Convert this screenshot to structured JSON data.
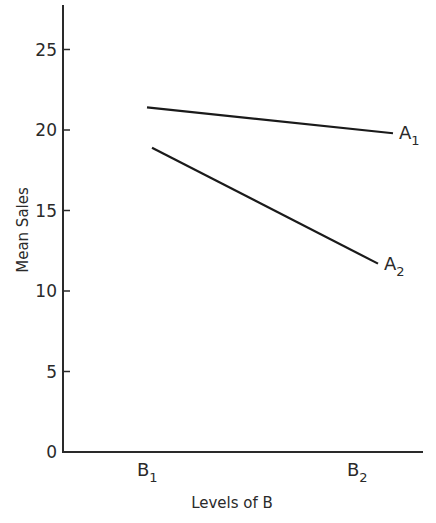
{
  "chart_data": {
    "type": "line",
    "title": "",
    "xlabel": "Levels of B",
    "ylabel": "Mean Sales",
    "categories": [
      "B1",
      "B2"
    ],
    "category_labels": [
      {
        "main": "B",
        "sub": "1"
      },
      {
        "main": "B",
        "sub": "2"
      }
    ],
    "series": [
      {
        "name": "A1",
        "label_main": "A",
        "label_sub": "1",
        "values": [
          21.4,
          19.8
        ]
      },
      {
        "name": "A2",
        "label_main": "A",
        "label_sub": "2",
        "values": [
          18.9,
          11.7
        ]
      }
    ],
    "yticks": [
      0,
      5,
      10,
      15,
      20,
      25
    ],
    "ylim": [
      0,
      27
    ],
    "grid": false,
    "legend": "inline labels at line ends"
  },
  "colors": {
    "line": "#1a1a1a",
    "axis": "#2a2a2a",
    "background": "#ffffff"
  }
}
